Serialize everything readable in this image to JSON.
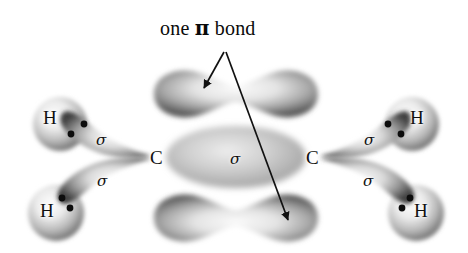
{
  "figure": {
    "kind": "orbital-diagram",
    "molecule": "ethylene",
    "title": {
      "prefix": "one ",
      "symbol": "π",
      "suffix": " bond"
    },
    "background_color": "#ffffff",
    "ink_color": "#111111"
  },
  "atoms": {
    "carbon_left": "C",
    "carbon_right": "C",
    "hydrogen_top_left": "H",
    "hydrogen_bottom_left": "H",
    "hydrogen_top_right": "H",
    "hydrogen_bottom_right": "H"
  },
  "bond_labels": {
    "sigma_top_left": "σ",
    "sigma_bottom_left": "σ",
    "sigma_center": "σ",
    "sigma_top_right": "σ",
    "sigma_bottom_right": "σ"
  },
  "orbitals": {
    "pi_lobe_top": "pi-lobe-top",
    "pi_lobe_bottom": "pi-lobe-bottom",
    "sigma_cc": "sigma-cc-ellipse",
    "sp2_top_left": "sp2-lobe-top-left",
    "sp2_bottom_left": "sp2-lobe-bottom-left",
    "sp2_top_right": "sp2-lobe-top-right",
    "sp2_bottom_right": "sp2-lobe-bottom-right"
  },
  "electron_pairs": {
    "top_left": 2,
    "bottom_left": 2,
    "top_right": 2,
    "bottom_right": 2
  },
  "annotation": {
    "leader_short_target": "pi-lobe-top",
    "leader_long_target": "pi-lobe-bottom",
    "arrow_count": 2
  },
  "colors": {
    "lobe_dark": "#4a4a4a",
    "lobe_mid": "#8d8d8d",
    "lobe_light": "#f2f2f2",
    "sigma_ellipse": "#b4b4b4",
    "arrow": "#111111"
  }
}
